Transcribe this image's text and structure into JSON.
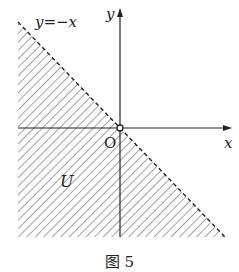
{
  "figure": {
    "caption": "图 5",
    "line_label": "y=−x",
    "x_axis_label": "x",
    "y_axis_label": "y",
    "origin_label": "O",
    "region_label": "U",
    "origin_marker": "open-circle",
    "boundary_style": "dashed",
    "region_description": "half-plane below y = -x (x + y < 0), hatched, boundary excluded"
  }
}
